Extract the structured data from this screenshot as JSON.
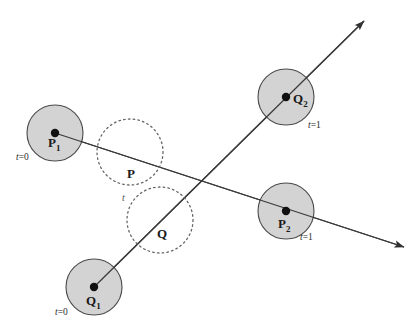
{
  "figure": {
    "background_color": "#ffffff",
    "width": 416,
    "height": 333
  },
  "style": {
    "solid_circle_fill": "#d3d3d3",
    "solid_circle_stroke": "#4a4a4a",
    "dotted_circle_stroke": "#666666",
    "line_color": "#3a3a3a",
    "dot_color": "#111111",
    "text_color": "#1a1a1a"
  },
  "solid_circles": [
    {
      "id": "P1",
      "label_main": "P",
      "label_sub": "1",
      "time_label": "t=0",
      "time_label_italic_part": "t",
      "time_label_rest": "=0",
      "cx": 55,
      "cy": 133,
      "r": 28,
      "label_x": 48,
      "label_y": 147,
      "time_x": 16,
      "time_y": 160
    },
    {
      "id": "P2",
      "label_main": "P",
      "label_sub": "2",
      "time_label": "t=1",
      "time_label_italic_part": "t",
      "time_label_rest": "=1",
      "cx": 286,
      "cy": 211,
      "r": 28,
      "label_x": 278,
      "label_y": 228,
      "time_x": 300,
      "time_y": 240
    },
    {
      "id": "Q1",
      "label_main": "Q",
      "label_sub": "1",
      "time_label": "t=0",
      "time_label_italic_part": "t",
      "time_label_rest": "=0",
      "cx": 94,
      "cy": 287,
      "r": 28,
      "label_x": 86,
      "label_y": 305,
      "time_x": 55,
      "time_y": 315
    },
    {
      "id": "Q2",
      "label_main": "Q",
      "label_sub": "2",
      "time_label": "t=1",
      "time_label_italic_part": "t",
      "time_label_rest": "=1",
      "cx": 286,
      "cy": 97,
      "r": 28,
      "label_x": 293,
      "label_y": 103,
      "time_x": 308,
      "time_y": 128
    }
  ],
  "dotted_circles": [
    {
      "id": "P",
      "label_main": "P",
      "cx": 130,
      "cy": 152,
      "r": 33,
      "label_x": 127,
      "label_y": 178
    },
    {
      "id": "Q",
      "label_main": "Q",
      "cx": 160,
      "cy": 220,
      "r": 33,
      "label_x": 157,
      "label_y": 238
    }
  ],
  "param_labels": [
    {
      "id": "t-interp",
      "text": "t",
      "x": 122,
      "y": 201
    }
  ],
  "trajectories": [
    {
      "id": "P-trajectory",
      "from": "P1",
      "to": "P2",
      "x1": 55,
      "y1": 133,
      "x2": 404,
      "y2": 247,
      "arrow_end": true,
      "arrow_label": "arrow-lower-right"
    },
    {
      "id": "Q-trajectory",
      "from": "Q1",
      "to": "Q2",
      "x1": 94,
      "y1": 287,
      "x2": 364,
      "y2": 21,
      "arrow_end": true,
      "arrow_label": "arrow-upper-right"
    }
  ],
  "center_dots": [
    {
      "id": "dot-P1",
      "cx": 55,
      "cy": 133,
      "r": 4.2
    },
    {
      "id": "dot-P2",
      "cx": 286,
      "cy": 211,
      "r": 4.2
    },
    {
      "id": "dot-Q1",
      "cx": 94,
      "cy": 287,
      "r": 4.2
    },
    {
      "id": "dot-Q2",
      "cx": 286,
      "cy": 97,
      "r": 4.2
    }
  ]
}
